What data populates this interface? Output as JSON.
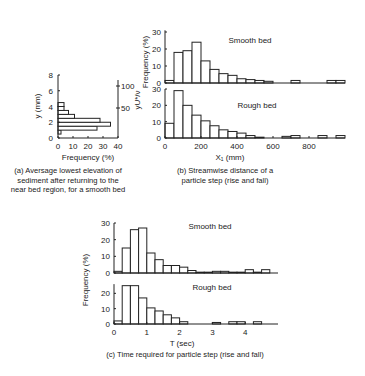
{
  "figure": {
    "captions": {
      "a": [
        "(a) Aversage lowest elevation of",
        "sediment after returning to the",
        "near bed region, for a smooth bed"
      ],
      "b": [
        "(b) Streamwise distance of a",
        "particle step (rise and fall)"
      ],
      "c": [
        "(c) Time required for particle step (rise and fall)"
      ]
    },
    "labels": {
      "a_ylabel": "y (mm)",
      "a_y2label": "yU*/ν",
      "a_xlabel": "Frequency (%)",
      "b_ylabel": "Frequency (%)",
      "b_xlabel": "X₁  (mm)",
      "b_top_title": "Smooth bed",
      "b_bottom_title": "Rough bed",
      "c_ylabel": "Frequency (%)",
      "c_xlabel": "T (sec)",
      "c_top_title": "Smooth bed",
      "c_bottom_title": "Rough bed"
    }
  },
  "chart_data": [
    {
      "id": "a",
      "type": "bar",
      "orientation": "horizontal",
      "title": "(a) Aversage lowest elevation of sediment after returning to the near bed region, for a smooth bed",
      "xlabel": "Frequency (%)",
      "ylabel": "y (mm)",
      "y2label": "yU*/ν",
      "xlim": [
        0,
        40
      ],
      "ylim": [
        0,
        8
      ],
      "xticks": [
        0,
        10,
        20,
        30,
        40
      ],
      "yticks": [
        0,
        2,
        4,
        6,
        8
      ],
      "y2ticks": [
        50,
        100
      ],
      "bins_y_mm": [
        [
          0.5,
          1.0
        ],
        [
          1.0,
          1.5
        ],
        [
          1.5,
          2.0
        ],
        [
          2.0,
          2.5
        ],
        [
          2.5,
          3.0
        ],
        [
          3.0,
          3.5
        ],
        [
          3.5,
          4.0
        ],
        [
          4.0,
          4.5
        ]
      ],
      "values": [
        2,
        26,
        35,
        28,
        11,
        7,
        4,
        0
      ]
    },
    {
      "id": "b-smooth",
      "type": "bar",
      "title": "Smooth bed",
      "xlabel": "X₁ (mm)",
      "ylabel": "Frequency (%)",
      "xlim": [
        0,
        1000
      ],
      "ylim": [
        0,
        30
      ],
      "xticks": [
        0,
        200,
        400,
        600,
        800
      ],
      "yticks": [
        0,
        10,
        20,
        30
      ],
      "bin_width": 50,
      "bin_starts": [
        0,
        50,
        100,
        150,
        200,
        250,
        300,
        350,
        400,
        450,
        500,
        550,
        600,
        650,
        700,
        750,
        800,
        850,
        900,
        950
      ],
      "values": [
        1.5,
        18,
        19,
        24,
        13,
        8,
        5.5,
        4.5,
        2.5,
        2,
        1.5,
        1,
        0,
        0,
        1.5,
        0,
        0,
        0,
        1.5,
        1.5
      ]
    },
    {
      "id": "b-rough",
      "type": "bar",
      "title": "Rough bed",
      "xlabel": "X₁ (mm)",
      "ylabel": "Frequency (%)",
      "xlim": [
        0,
        1000
      ],
      "ylim": [
        0,
        30
      ],
      "xticks": [
        0,
        200,
        400,
        600,
        800
      ],
      "yticks": [
        0,
        10,
        20,
        30
      ],
      "bin_width": 50,
      "bin_starts": [
        0,
        50,
        100,
        150,
        200,
        250,
        300,
        350,
        400,
        450,
        500,
        550,
        600,
        650,
        700,
        750,
        800,
        850,
        900,
        950
      ],
      "values": [
        9,
        29,
        20,
        14,
        10.5,
        7.5,
        5,
        4,
        3,
        1.5,
        0.5,
        0,
        0,
        1,
        1.5,
        0,
        0,
        1.5,
        0,
        1.5
      ]
    },
    {
      "id": "c-smooth",
      "type": "bar",
      "title": "Smooth bed",
      "xlabel": "T (sec)",
      "ylabel": "Frequency (%)",
      "xlim": [
        0,
        5
      ],
      "ylim": [
        0,
        30
      ],
      "xticks": [
        0,
        1,
        2,
        3,
        4
      ],
      "yticks": [
        0,
        10,
        20,
        30
      ],
      "bin_width": 0.25,
      "bin_starts": [
        0,
        0.25,
        0.5,
        0.75,
        1.0,
        1.25,
        1.5,
        1.75,
        2.0,
        2.25,
        2.5,
        2.75,
        3.0,
        3.25,
        3.5,
        3.75,
        4.0,
        4.25,
        4.5,
        4.75
      ],
      "values": [
        1,
        15,
        26,
        27,
        12,
        8,
        4.5,
        4.5,
        3.5,
        1.5,
        0.5,
        0.5,
        1,
        1,
        0.5,
        0.5,
        2,
        0.5,
        2,
        0
      ]
    },
    {
      "id": "c-rough",
      "type": "bar",
      "title": "Rough bed",
      "xlabel": "T (sec)",
      "ylabel": "Frequency (%)",
      "xlim": [
        0,
        5
      ],
      "ylim": [
        0,
        30
      ],
      "xticks": [
        0,
        1,
        2,
        3,
        4
      ],
      "yticks": [
        0,
        10,
        20
      ],
      "bin_width": 0.25,
      "bin_starts": [
        0,
        0.25,
        0.5,
        0.75,
        1.0,
        1.25,
        1.5,
        1.75,
        2.0,
        2.25,
        2.5,
        2.75,
        3.0,
        3.25,
        3.5,
        3.75,
        4.0,
        4.25,
        4.5,
        4.75
      ],
      "values": [
        2,
        25,
        25,
        17,
        10.5,
        8.5,
        6,
        4,
        1.5,
        0,
        0,
        0,
        1,
        0,
        1.5,
        1.5,
        0,
        1.5,
        0,
        0
      ]
    }
  ]
}
